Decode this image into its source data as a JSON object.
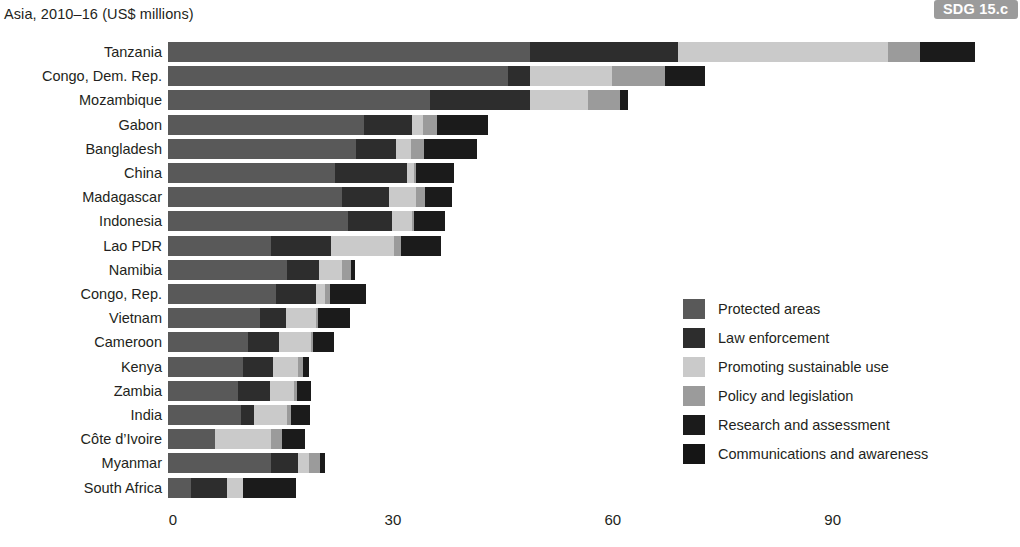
{
  "header": {
    "title": "Asia, 2010–16 (US$ millions)",
    "badge": "SDG 15.c"
  },
  "axis": {
    "ticks": [
      "0",
      "30",
      "60",
      "90"
    ]
  },
  "legend": {
    "items": [
      {
        "label": "Protected areas",
        "color": "#595959"
      },
      {
        "label": "Law enforcement",
        "color": "#2d2d2d"
      },
      {
        "label": "Promoting sustainable use",
        "color": "#cacaca"
      },
      {
        "label": "Policy and legislation",
        "color": "#9b9b9b"
      },
      {
        "label": "Research and assessment",
        "color": "#1b1b1b"
      },
      {
        "label": "Communications and awareness",
        "color": "#151515"
      }
    ]
  },
  "chart_data": {
    "type": "bar",
    "orientation": "horizontal",
    "stacked": true,
    "title": "Asia, 2010–16 (US$ millions)",
    "xlabel": "",
    "ylabel": "",
    "xlim": [
      0,
      110
    ],
    "xticks": [
      0,
      30,
      60,
      90
    ],
    "grid": false,
    "legend_position": "center-right",
    "units": "US$ millions",
    "categories": [
      "Tanzania",
      "Congo, Dem. Rep.",
      "Mozambique",
      "Gabon",
      "Bangladesh",
      "China",
      "Madagascar",
      "Indonesia",
      "Lao PDR",
      "Namibia",
      "Congo, Rep.",
      "Vietnam",
      "Cameroon",
      "Kenya",
      "Zambia",
      "India",
      "Côte d’Ivoire",
      "Myanmar",
      "South Africa"
    ],
    "series": [
      {
        "name": "Protected areas",
        "color": "#595959",
        "values": [
          49.4,
          46.4,
          35.8,
          26.8,
          25.6,
          22.8,
          23.8,
          24.6,
          14.1,
          16.2,
          14.7,
          12.5,
          10.9,
          10.2,
          9.5,
          10.0,
          6.4,
          14.1,
          3.2
        ]
      },
      {
        "name": "Law enforcement",
        "color": "#2d2d2d",
        "values": [
          20.2,
          3.0,
          13.6,
          6.5,
          5.5,
          9.8,
          6.3,
          6.0,
          8.1,
          4.4,
          5.5,
          3.6,
          4.3,
          4.1,
          4.4,
          1.8,
          0.0,
          3.7,
          4.9
        ]
      },
      {
        "name": "Promoting sustainable use",
        "color": "#cacaca",
        "values": [
          28.6,
          11.2,
          7.9,
          1.5,
          2.1,
          0.9,
          3.8,
          2.7,
          8.6,
          3.2,
          1.2,
          4.1,
          4.3,
          3.5,
          3.3,
          4.5,
          7.6,
          1.4,
          2.2
        ]
      },
      {
        "name": "Policy and legislation",
        "color": "#9b9b9b",
        "values": [
          4.4,
          7.2,
          4.4,
          1.9,
          1.7,
          0.4,
          1.2,
          0.2,
          1.0,
          1.1,
          0.7,
          0.3,
          0.3,
          0.6,
          0.4,
          0.5,
          1.5,
          1.5,
          0.0
        ]
      },
      {
        "name": "Research and assessment",
        "color": "#1b1b1b",
        "values": [
          7.5,
          5.5,
          1.0,
          6.9,
          7.2,
          5.1,
          3.6,
          4.3,
          5.4,
          0.6,
          4.9,
          4.3,
          2.8,
          0.8,
          1.9,
          2.6,
          3.2,
          0.7,
          7.2
        ]
      },
      {
        "name": "Communications and awareness",
        "color": "#151515",
        "values": [
          0.0,
          0.0,
          0.0,
          0.0,
          0.0,
          0.0,
          0.0,
          0.0,
          0.0,
          0.0,
          0.0,
          0.0,
          0.0,
          0.0,
          0.0,
          0.0,
          0.0,
          0.0,
          0.0
        ]
      }
    ],
    "totals": [
      110.1,
      73.3,
      62.7,
      43.6,
      42.1,
      39.0,
      38.7,
      37.8,
      37.2,
      25.5,
      27.0,
      24.8,
      22.6,
      19.2,
      19.5,
      19.4,
      18.7,
      21.4,
      17.5
    ]
  },
  "layout": {
    "bar_origin_x": 168,
    "px_per_unit": 7.33,
    "row_pitch": 24.2,
    "bar_height": 20,
    "plot_top": 42
  }
}
